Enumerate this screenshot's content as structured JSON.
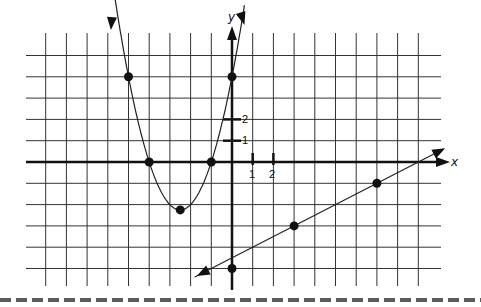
{
  "chart_data": {
    "type": "line",
    "title": "",
    "xlabel": "x",
    "ylabel": "y",
    "x_tick_labels": [
      "1",
      "2"
    ],
    "y_tick_labels": [
      "1",
      "2"
    ],
    "grid": true,
    "xlim": [
      -9,
      9
    ],
    "ylim": [
      -5,
      5
    ],
    "series": [
      {
        "name": "parabola",
        "type": "curve",
        "equation": "y = x^2 + 5x + 4",
        "points": [
          [
            -5,
            4
          ],
          [
            -4,
            0
          ],
          [
            -2.5,
            -2.25
          ],
          [
            -1,
            0
          ],
          [
            0,
            4
          ]
        ]
      },
      {
        "name": "line",
        "type": "line",
        "equation": "y = 0.5x - 4.5",
        "points": [
          [
            0,
            -5
          ],
          [
            3,
            -3
          ],
          [
            7,
            -1
          ]
        ]
      }
    ]
  },
  "labels": {
    "x_axis": "x",
    "y_axis": "y",
    "tick1": "1",
    "tick2": "2"
  }
}
